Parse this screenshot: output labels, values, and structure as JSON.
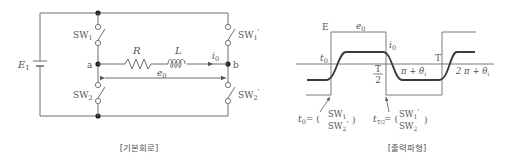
{
  "circuit": {
    "caption": "[기본회로]",
    "source_label": "E",
    "source_sub": "1",
    "node_a": "a",
    "node_b": "b",
    "resistor": "R",
    "inductor": "L",
    "current": "i",
    "current_sub": "0",
    "voltage": "e",
    "voltage_sub": "0",
    "switches": [
      {
        "id": "SW1",
        "base": "SW",
        "sub": "1",
        "prime": ""
      },
      {
        "id": "SW2",
        "base": "SW",
        "sub": "2",
        "prime": ""
      },
      {
        "id": "SW1'",
        "base": "SW",
        "sub": "1",
        "prime": "'"
      },
      {
        "id": "SW2'",
        "base": "SW",
        "sub": "2",
        "prime": "'"
      }
    ]
  },
  "waveform": {
    "caption": "[출력파형]",
    "voltage_amplitude": "E",
    "voltage_label": "e",
    "voltage_sub": "0",
    "current_label": "i",
    "current_sub": "0",
    "t0_label": "t",
    "t0_sub": "0",
    "half_period_num": "T",
    "half_period_den": "2",
    "period": "T",
    "phase1": "π + θ",
    "phase1_sub": "i",
    "phase2": "2 π + θ",
    "phase2_sub": "i",
    "annot1": {
      "lhs": "t",
      "lhs_sub": "0",
      "eq": "= (",
      "top": "SW",
      "top_sub": "1",
      "top_prime": "",
      "bottom": "SW",
      "bottom_sub": "2",
      "bottom_prime": "'",
      "close": ")"
    },
    "annot2": {
      "lhs": "t",
      "lhs_sub": "T/2",
      "eq": "= (",
      "top": "SW",
      "top_sub": "1",
      "top_prime": "'",
      "bottom": "SW",
      "bottom_sub": "2",
      "bottom_prime": "",
      "close": ")"
    }
  }
}
